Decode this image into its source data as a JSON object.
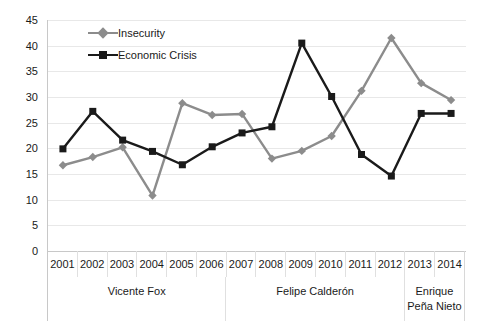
{
  "chart_data": {
    "type": "line",
    "title": "",
    "subtitle": "",
    "xlabel": "",
    "ylabel": "",
    "ylim": [
      0,
      45
    ],
    "ytick_step": 5,
    "yticks": [
      45,
      40,
      35,
      30,
      25,
      20,
      15,
      10,
      5,
      0
    ],
    "grid": true,
    "legend_position": "top-left-inside",
    "categories": [
      "2001",
      "2002",
      "2003",
      "2004",
      "2005",
      "2006",
      "2007",
      "2008",
      "2009",
      "2010",
      "2011",
      "2012",
      "2013",
      "2014"
    ],
    "series": [
      {
        "name": "Insecurity",
        "color": "#8c8c8c",
        "marker": "diamond",
        "values": [
          16.7,
          18.3,
          20.2,
          10.8,
          28.8,
          26.5,
          26.7,
          18.0,
          19.5,
          22.4,
          31.2,
          41.5,
          32.7,
          29.4
        ]
      },
      {
        "name": "Economic Crisis",
        "color": "#1a1a1a",
        "marker": "square",
        "values": [
          19.9,
          27.2,
          21.6,
          19.4,
          16.8,
          20.3,
          23.0,
          24.2,
          40.5,
          30.1,
          18.8,
          14.6,
          26.8,
          26.8
        ]
      }
    ],
    "period_bands": [
      {
        "label": "Vicente Fox",
        "span": 6
      },
      {
        "label": "Felipe Calderón",
        "span": 6
      },
      {
        "label": "Enrique\nPeña Nieto",
        "span": 2
      }
    ]
  },
  "colors": {
    "insecurity": "#8c8c8c",
    "economic_crisis": "#1a1a1a",
    "gridline": "#e8e8e8",
    "axis": "#c8c8c8",
    "background": "#ffffff",
    "text": "#1a1a1a"
  }
}
